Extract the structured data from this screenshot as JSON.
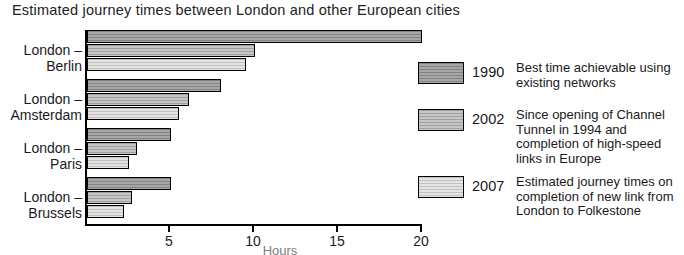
{
  "chart_data": {
    "type": "bar",
    "orientation": "horizontal",
    "title": "Estimated journey times between London and other European cities",
    "xlabel": "Hours",
    "ylabel": "",
    "xlim": [
      0,
      20
    ],
    "xticks": [
      5,
      10,
      15,
      20
    ],
    "xtick_labels": [
      "5",
      "10",
      "15",
      "20"
    ],
    "grid": false,
    "legend_position": "right",
    "categories": [
      "London – Berlin",
      "London – Amsterdam",
      "London – Paris",
      "London – Brussels"
    ],
    "series": [
      {
        "name": "1990",
        "color": "#9d9d9d",
        "values": [
          20,
          8,
          5,
          5
        ]
      },
      {
        "name": "2002",
        "color": "#bdbdbd",
        "values": [
          10,
          6.1,
          3,
          2.7
        ]
      },
      {
        "name": "2007",
        "color": "#dedede",
        "values": [
          9.5,
          5.5,
          2.5,
          2.2
        ]
      }
    ]
  },
  "title": "Estimated journey times between London and other European cities",
  "axis": {
    "x_title": "Hours",
    "ticks": [
      {
        "value": 5,
        "label": "5"
      },
      {
        "value": 10,
        "label": "10"
      },
      {
        "value": 15,
        "label": "15"
      },
      {
        "value": 20,
        "label": "20"
      }
    ]
  },
  "categories": [
    {
      "line1": "London –",
      "line2": "Berlin"
    },
    {
      "line1": "London –",
      "line2": "Amsterdam"
    },
    {
      "line1": "London –",
      "line2": "Paris"
    },
    {
      "line1": "London –",
      "line2": "Brussels"
    }
  ],
  "legend": [
    {
      "year": "1990",
      "color": "#9d9d9d",
      "description": "Best time achievable using existing networks"
    },
    {
      "year": "2002",
      "color": "#bdbdbd",
      "description": "Since opening of Channel Tunnel in 1994 and completion of high-speed links in Europe"
    },
    {
      "year": "2007",
      "color": "#dedede",
      "description": "Estimated journey times on completion of new link from London to Folkestone"
    }
  ]
}
